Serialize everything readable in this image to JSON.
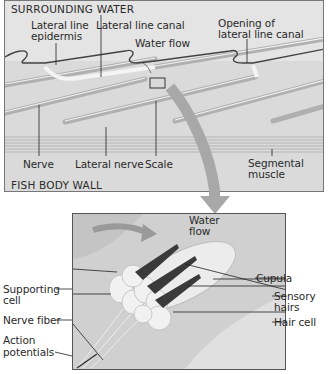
{
  "top_panel": {
    "region_top": "SURROUNDING WATER",
    "region_bottom": "FISH BODY WALL",
    "labels": {
      "lateral_line_epidermis_1": "Lateral line",
      "lateral_line_epidermis_2": "epidermis",
      "lateral_line_canal": "Lateral line canal",
      "water_flow": "Water flow",
      "opening_1": "Opening of",
      "opening_2": "lateral line canal",
      "nerve": "Nerve",
      "lateral_nerve": "Lateral nerve",
      "scale": "Scale",
      "segmental_muscle_1": "Segmental",
      "segmental_muscle_2": "muscle"
    }
  },
  "bottom_panel": {
    "labels": {
      "water_flow_1": "Water",
      "water_flow_2": "flow",
      "cupula": "Cupula",
      "supporting_cell_1": "Supporting",
      "supporting_cell_2": "cell",
      "sensory_hairs_1": "Sensory",
      "sensory_hairs_2": "hairs",
      "nerve_fiber": "Nerve fiber",
      "hair_cell": "Hair cell",
      "action_potentials_1": "Action",
      "action_potentials_2": "potentials"
    }
  },
  "colors": {
    "panel_bg": "#e4e4e4",
    "arrow": "#a8a8a8",
    "sensory_hair": "#3a3a3a"
  }
}
